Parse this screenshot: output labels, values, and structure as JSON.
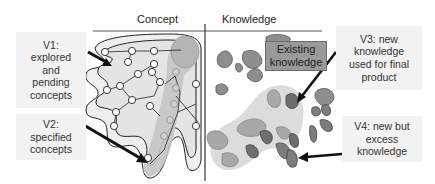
{
  "headers": {
    "concept": "Concept",
    "knowledge": "Knowledge"
  },
  "labels": {
    "v1": "V1: explored and pending concepts",
    "v2": "V2: specified concepts",
    "v3": "V3: new knowledge used for final product",
    "v4": "V4: new but excess knowledge",
    "existing": "Existing knowledge"
  },
  "labels_lines": {
    "v1": [
      "V1:",
      "explored",
      "and",
      "pending",
      "concepts"
    ],
    "v2": [
      "V2:",
      "specified",
      "concepts"
    ],
    "v3": [
      "V3: new",
      "knowledge",
      "used for final",
      "product"
    ],
    "v4": [
      "V4: new but",
      "excess",
      "knowledge"
    ],
    "existing": [
      "Existing",
      "knowledge"
    ]
  },
  "colors": {
    "label_bg": "#f2f2f2",
    "existing_bg": "#9a9a9a",
    "blob_dark": "#6f6f6f",
    "blob_mid": "#8c8c8c",
    "light_region": "#dcdcdc",
    "path_region": "#bdbdbd",
    "line": "#222222"
  }
}
